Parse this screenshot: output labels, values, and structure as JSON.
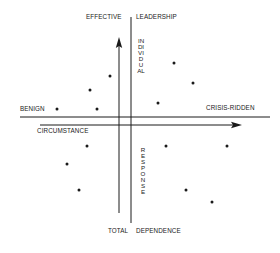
{
  "diagram": {
    "labels": {
      "top_left": "EFFECTIVE",
      "top_right": "LEADERSHIP",
      "left": "BENIGN",
      "right": "CRISIS-RIDDEN",
      "horizontal_axis": "CIRCUMSTANCE",
      "bottom_left": "TOTAL",
      "bottom_right": "DEPENDENCE",
      "vertical_upper": "INDIVIDUAL",
      "vertical_lower": "RESPONSE"
    },
    "axes": {
      "horizontal_thin_line": {
        "x1": 20,
        "x2": 270,
        "y": 117
      },
      "horizontal_arrow": {
        "x1": 40,
        "x2": 242,
        "y": 125,
        "direction": "right"
      },
      "vertical_thin_line": {
        "x": 131,
        "y1": 17,
        "y2": 223
      },
      "vertical_arrow": {
        "x": 119,
        "y1": 213,
        "y2": 37,
        "direction": "up"
      }
    },
    "points": [
      {
        "quadrant": "upper-left",
        "x": 110,
        "y": 76
      },
      {
        "quadrant": "upper-left",
        "x": 90,
        "y": 90
      },
      {
        "quadrant": "upper-left",
        "x": 57,
        "y": 109
      },
      {
        "quadrant": "upper-left",
        "x": 97,
        "y": 109
      },
      {
        "quadrant": "upper-right",
        "x": 174,
        "y": 63
      },
      {
        "quadrant": "upper-right",
        "x": 193,
        "y": 83
      },
      {
        "quadrant": "upper-right",
        "x": 158,
        "y": 103
      },
      {
        "quadrant": "lower-left",
        "x": 87,
        "y": 146
      },
      {
        "quadrant": "lower-left",
        "x": 67,
        "y": 164
      },
      {
        "quadrant": "lower-left",
        "x": 79,
        "y": 190
      },
      {
        "quadrant": "lower-right",
        "x": 166,
        "y": 146
      },
      {
        "quadrant": "lower-right",
        "x": 227,
        "y": 146
      },
      {
        "quadrant": "lower-right",
        "x": 186,
        "y": 190
      },
      {
        "quadrant": "lower-right",
        "x": 212,
        "y": 202
      }
    ],
    "colors": {
      "ink": "#1a1a1a",
      "background": "#ffffff"
    }
  }
}
